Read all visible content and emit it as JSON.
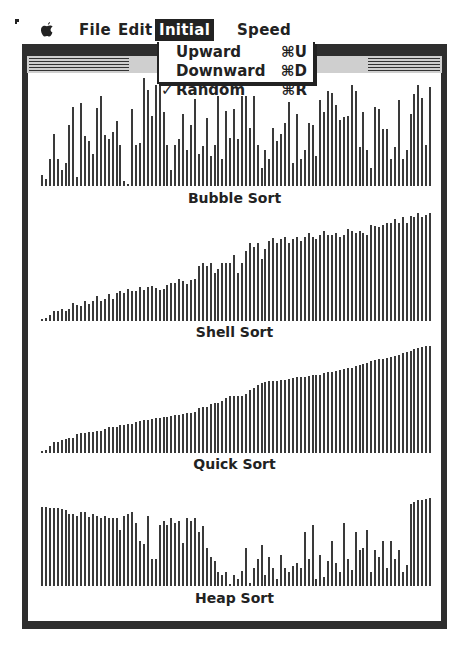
{
  "menubar": {
    "items": [
      {
        "label": "File"
      },
      {
        "label": "Edit"
      },
      {
        "label": "Initial",
        "active": true
      },
      {
        "label": "Speed"
      }
    ]
  },
  "dropdown": {
    "items": [
      {
        "check": "",
        "label": "Upward",
        "shortcut": "⌘U"
      },
      {
        "check": "",
        "label": "Downward",
        "shortcut": "⌘D"
      },
      {
        "check": "✓",
        "label": "Random",
        "shortcut": "⌘R"
      }
    ]
  },
  "window": {
    "title": "Ada 95 Sort Race"
  },
  "chart_data": [
    {
      "type": "bar",
      "title": "Bubble Sort",
      "values": [
        12,
        8,
        30,
        58,
        30,
        18,
        25,
        68,
        88,
        10,
        92,
        55,
        50,
        35,
        87,
        100,
        57,
        52,
        60,
        72,
        45,
        5,
        2,
        85,
        45,
        48,
        120,
        107,
        78,
        112,
        113,
        82,
        45,
        18,
        45,
        52,
        80,
        40,
        68,
        97,
        35,
        44,
        75,
        33,
        45,
        100,
        30,
        83,
        53,
        85,
        52,
        100,
        100,
        65,
        100,
        45,
        20,
        40,
        30,
        65,
        50,
        58,
        70,
        93,
        25,
        80,
        30,
        40,
        70,
        68,
        33,
        95,
        82,
        105,
        103,
        90,
        73,
        77,
        78,
        112,
        105,
        43,
        82,
        40,
        20,
        88,
        85,
        63,
        63,
        30,
        43,
        95,
        30,
        40,
        80,
        102,
        112,
        98,
        45,
        110
      ],
      "ylim": [
        0,
        120
      ],
      "grid": false
    },
    {
      "type": "bar",
      "title": "Shell Sort",
      "values": [
        2,
        3,
        6,
        10,
        10,
        12,
        10,
        12,
        18,
        16,
        15,
        20,
        17,
        20,
        25,
        20,
        22,
        27,
        22,
        28,
        30,
        28,
        32,
        30,
        30,
        34,
        31,
        34,
        35,
        33,
        31,
        32,
        36,
        38,
        38,
        42,
        40,
        37,
        41,
        42,
        55,
        58,
        55,
        58,
        48,
        52,
        58,
        58,
        58,
        66,
        48,
        58,
        70,
        78,
        74,
        78,
        62,
        72,
        80,
        83,
        78,
        82,
        84,
        78,
        82,
        84,
        80,
        84,
        88,
        84,
        82,
        86,
        90,
        86,
        86,
        88,
        84,
        86,
        92,
        90,
        88,
        90,
        88,
        86,
        96,
        95,
        94,
        96,
        98,
        98,
        102,
        98,
        104,
        98,
        105,
        104,
        108,
        104,
        106,
        108
      ],
      "ylim": [
        0,
        110
      ],
      "grid": false
    },
    {
      "type": "bar",
      "title": "Quick Sort",
      "values": [
        2,
        3,
        6,
        10,
        10,
        12,
        13,
        14,
        14,
        17,
        18,
        18,
        19,
        19,
        20,
        20,
        22,
        24,
        24,
        24,
        26,
        26,
        27,
        27,
        28,
        29,
        30,
        30,
        31,
        32,
        32,
        33,
        33,
        34,
        35,
        35,
        36,
        37,
        37,
        38,
        41,
        42,
        42,
        45,
        46,
        46,
        48,
        50,
        52,
        52,
        52,
        52,
        54,
        58,
        60,
        62,
        64,
        65,
        66,
        66,
        66,
        67,
        67,
        68,
        69,
        70,
        70,
        70,
        71,
        72,
        72,
        72,
        73,
        74,
        74,
        75,
        76,
        77,
        78,
        78,
        80,
        81,
        82,
        83,
        84,
        85,
        86,
        86,
        87,
        88,
        89,
        90,
        92,
        93,
        94,
        95,
        96,
        97,
        98,
        98
      ],
      "ylim": [
        0,
        100
      ],
      "grid": false
    },
    {
      "type": "bar",
      "title": "Heap Sort",
      "values": [
        88,
        88,
        87,
        87,
        87,
        86,
        84,
        80,
        80,
        78,
        82,
        82,
        77,
        80,
        78,
        76,
        78,
        76,
        76,
        76,
        62,
        78,
        80,
        82,
        70,
        50,
        47,
        78,
        30,
        30,
        68,
        72,
        68,
        76,
        70,
        72,
        48,
        75,
        72,
        75,
        60,
        67,
        42,
        32,
        28,
        15,
        12,
        15,
        2,
        12,
        8,
        17,
        42,
        3,
        20,
        30,
        45,
        12,
        32,
        20,
        8,
        35,
        20,
        15,
        22,
        25,
        20,
        60,
        30,
        68,
        8,
        35,
        10,
        28,
        50,
        25,
        15,
        70,
        30,
        18,
        60,
        40,
        42,
        62,
        15,
        40,
        32,
        50,
        20,
        50,
        30,
        40,
        15,
        23,
        91,
        93,
        95,
        96,
        97,
        98
      ],
      "ylim": [
        0,
        100
      ],
      "grid": false
    }
  ]
}
